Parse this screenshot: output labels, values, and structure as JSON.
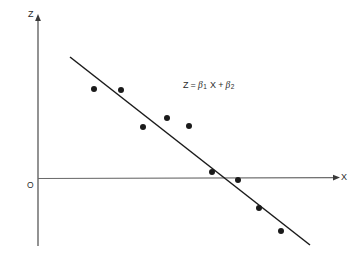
{
  "figure": {
    "title": "",
    "background_color": "#ffffff",
    "ink_color": "#1a1a1a",
    "axis_color": "#4a4a4a"
  },
  "axes": {
    "y_axis_label": "Z",
    "x_axis_label": "X",
    "origin_label": "O"
  },
  "equation": {
    "lhs": "Z",
    "equals": "=",
    "beta_symbol": "β",
    "slope_subscript": "1",
    "variable": "X",
    "plus": "+",
    "intercept_subscript": "2",
    "full_text": "Z = β1 X + β2"
  },
  "chart_data": {
    "type": "scatter",
    "title": "",
    "xlabel": "X",
    "ylabel": "Z",
    "grid": false,
    "legend": null,
    "annotations": [
      {
        "text": "Z = β1 X + β2",
        "x": 183,
        "y": 88
      },
      {
        "text": "O",
        "x": 30,
        "y": 186
      }
    ],
    "axis_pixel_geometry": {
      "y_axis_x": 38,
      "y_axis_top": 16,
      "y_axis_bottom": 246,
      "x_axis_y": 178,
      "x_axis_left": 38,
      "x_axis_right": 340
    },
    "points": [
      {
        "px": 94,
        "py": 89
      },
      {
        "px": 121,
        "py": 90
      },
      {
        "px": 143,
        "py": 127
      },
      {
        "px": 167,
        "py": 118
      },
      {
        "px": 189,
        "py": 126
      },
      {
        "px": 212,
        "py": 172
      },
      {
        "px": 238,
        "py": 180
      },
      {
        "px": 259,
        "py": 208
      },
      {
        "px": 281,
        "py": 231
      }
    ],
    "x": [
      94,
      121,
      143,
      167,
      189,
      212,
      238,
      259,
      281
    ],
    "values": [
      89,
      90,
      127,
      118,
      126,
      172,
      180,
      208,
      231
    ],
    "fit_line": {
      "name": "Z = β1 X + β2",
      "x1": 70,
      "y1": 57,
      "x2": 310,
      "y2": 245,
      "slope_sign": "negative"
    },
    "point_radius": 3.0
  }
}
